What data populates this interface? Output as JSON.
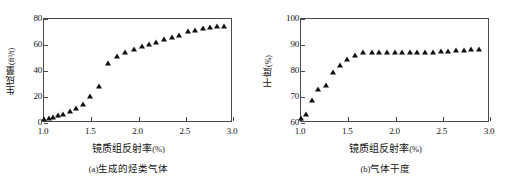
{
  "figure": {
    "panels": [
      {
        "id": "panel-a",
        "caption_tag": "(a)",
        "caption_text": "生成的烃类气体",
        "ylabel_text": "生成量",
        "ylabel_unit": "(ft³/t)",
        "xlabel_text": "镜质组反射率",
        "xlabel_unit": "(%)"
      },
      {
        "id": "panel-b",
        "caption_tag": "(b)",
        "caption_text": "气体干度",
        "ylabel_text": "干度",
        "ylabel_unit": "(%)",
        "xlabel_text": "镜质组反射率",
        "xlabel_unit": "(%)"
      }
    ]
  },
  "chart_data": [
    {
      "type": "scatter",
      "id": "panel-a",
      "title": "(a)生成的烃类气体",
      "xlabel": "镜质组反射率(%)",
      "ylabel": "生成量(ft³/t)",
      "xlim": [
        1.0,
        3.0
      ],
      "ylim": [
        0,
        80
      ],
      "xticks": [
        1.0,
        1.5,
        2.0,
        2.5,
        3.0
      ],
      "xticklabels": [
        "1.0",
        "1.5",
        "2.0",
        "2.5",
        "3.0"
      ],
      "yticks": [
        0,
        20,
        40,
        60,
        80
      ],
      "yticklabels": [
        "0",
        "20",
        "40",
        "60",
        "80"
      ],
      "grid": false,
      "legend": false,
      "marker": "triangle",
      "marker_color": "#111111",
      "series": [
        {
          "name": "生成量",
          "x": [
            1.0,
            1.05,
            1.1,
            1.15,
            1.2,
            1.27,
            1.34,
            1.41,
            1.49,
            1.58,
            1.68,
            1.77,
            1.86,
            1.95,
            2.04,
            2.11,
            2.19,
            2.27,
            2.35,
            2.43,
            2.52,
            2.6,
            2.68,
            2.76,
            2.83,
            2.9
          ],
          "y": [
            3.0,
            4.2,
            5.0,
            6.2,
            7.0,
            9.5,
            11.5,
            14.5,
            21.0,
            28.5,
            46.0,
            51.5,
            54.5,
            57.0,
            59.5,
            61.0,
            62.5,
            64.5,
            66.5,
            68.0,
            70.5,
            71.5,
            73.0,
            73.5,
            74.5,
            75.0
          ]
        }
      ]
    },
    {
      "type": "scatter",
      "id": "panel-b",
      "title": "(b)气体干度",
      "xlabel": "镜质组反射率(%)",
      "ylabel": "干度(%)",
      "xlim": [
        1.0,
        3.0
      ],
      "ylim": [
        60,
        100
      ],
      "xticks": [
        1.0,
        1.5,
        2.0,
        2.5,
        3.0
      ],
      "xticklabels": [
        "1.0",
        "1.5",
        "2.0",
        "2.5",
        "3.0"
      ],
      "yticks": [
        60,
        70,
        80,
        90,
        100
      ],
      "yticklabels": [
        "60",
        "70",
        "80",
        "90",
        "100"
      ],
      "grid": false,
      "legend": false,
      "marker": "triangle",
      "marker_color": "#111111",
      "series": [
        {
          "name": "干度",
          "x": [
            1.0,
            1.05,
            1.12,
            1.18,
            1.26,
            1.34,
            1.41,
            1.49,
            1.57,
            1.66,
            1.75,
            1.83,
            1.91,
            1.99,
            2.07,
            2.15,
            2.23,
            2.31,
            2.4,
            2.48,
            2.56,
            2.64,
            2.72,
            2.8,
            2.88
          ],
          "y": [
            62.0,
            63.5,
            68.8,
            73.0,
            74.5,
            79.8,
            82.5,
            84.5,
            86.2,
            87.2,
            87.5,
            87.4,
            87.3,
            87.3,
            87.2,
            87.3,
            87.3,
            87.4,
            87.5,
            87.6,
            87.8,
            88.0,
            88.1,
            88.3,
            88.4
          ]
        }
      ]
    }
  ]
}
